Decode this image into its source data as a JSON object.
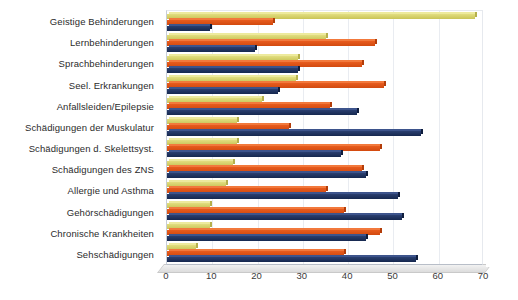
{
  "chart_data": {
    "type": "bar",
    "orientation": "horizontal",
    "title": "",
    "subtitle": "",
    "xlabel": "",
    "ylabel": "",
    "xlim": [
      0,
      70
    ],
    "xticks": [
      0,
      10,
      20,
      30,
      40,
      50,
      60,
      70
    ],
    "grid": true,
    "legend": "none",
    "categories": [
      "Geistige Behinderungen",
      "Lernbehinderungen",
      "Sprachbehinderungen",
      "Seel. Erkrankungen",
      "Anfallsleiden/Epilepsie",
      "Schädigungen der Muskulatur",
      "Schädigungen d. Skelettsyst.",
      "Schädigungen des ZNS",
      "Allergie und Asthma",
      "Gehörschädigungen",
      "Chronische Krankheiten",
      "Sehschädigungen"
    ],
    "series": [
      {
        "name": "series-1",
        "color": "#d2cd62",
        "values": [
          68,
          35,
          29,
          28.5,
          21,
          15.5,
          15.5,
          14.5,
          13,
          9.5,
          9.5,
          6.5
        ]
      },
      {
        "name": "series-2",
        "color": "#de5216",
        "values": [
          23.5,
          46,
          43,
          48,
          36,
          27,
          47,
          43,
          35,
          39,
          47,
          39
        ]
      },
      {
        "name": "series-3",
        "color": "#203560",
        "values": [
          9.5,
          19.5,
          29,
          24.5,
          42,
          56,
          38.5,
          44,
          51,
          52,
          44,
          55
        ]
      }
    ]
  }
}
